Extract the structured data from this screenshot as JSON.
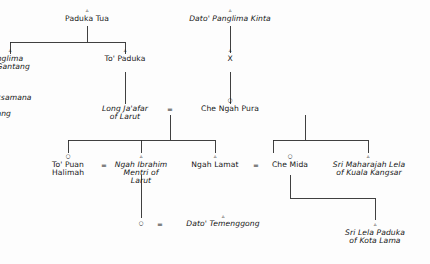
{
  "diagram": {
    "kind": "genealogy-family-tree",
    "line_color": "#2b2b2b",
    "text_color": "#151515",
    "background": "#fdfdfd",
    "symbols": {
      "male": "▵",
      "female": "○",
      "marriage": "=",
      "unknown": "X"
    }
  },
  "nodes": {
    "paduka_tua": {
      "line1": "Paduka Tua",
      "line2": "",
      "line3": ""
    },
    "dato_panglima_kinta": {
      "line1": "Dato' Panglima Kinta",
      "line2": "",
      "line3": ""
    },
    "to_panglima_bukit_gantang": {
      "line1": "To' Panglima",
      "line2": "Bukit Gantang",
      "line3": ""
    },
    "to_paduka": {
      "line1": "To' Paduka",
      "line2": "",
      "line3": ""
    },
    "x_unknown": {
      "line1": "X",
      "line2": "",
      "line3": ""
    },
    "to_laksamana_durian_sabatang": {
      "line1": "To' Laksamana",
      "line2": "Durian",
      "line3": "Sabatang"
    },
    "long_jaafar": {
      "line1": "Long Ja'afar",
      "line2": "of Larut",
      "line3": ""
    },
    "che_ngah_pura": {
      "line1": "Che Ngah Pura",
      "line2": "",
      "line3": ""
    },
    "to_puan_halimah": {
      "line1": "To' Puan",
      "line2": "Halimah",
      "line3": ""
    },
    "ngah_ibrahim": {
      "line1": "Ngah Ibrahim",
      "line2": "Mentri of",
      "line3": "Larut"
    },
    "ngah_lamat": {
      "line1": "Ngah Lamat",
      "line2": "",
      "line3": ""
    },
    "che_mida": {
      "line1": "Che Mida",
      "line2": "",
      "line3": ""
    },
    "sri_maharajah_lela": {
      "line1": "Sri Maharajah Lela",
      "line2": "of Kuala Kangsar",
      "line3": ""
    },
    "dato_temenggong": {
      "line1": "Dato' Temenggong",
      "line2": "",
      "line3": ""
    },
    "sri_lela_paduka": {
      "line1": "Sri Lela Paduka",
      "line2": "of Kota Lama",
      "line3": ""
    }
  },
  "marriage_symbols": {
    "jaafar_pura": "=",
    "halimah_ibrahim": "=",
    "lamat_mida": "=",
    "daughter_temenggong": "="
  },
  "gender_symbols": {
    "paduka_tua": "▵",
    "dato_panglima_kinta": "▵",
    "to_panglima_bukit_gantang": "▵",
    "to_paduka": "▵",
    "x_unknown": "▵",
    "che_ngah_pura": "○",
    "to_puan_halimah": "○",
    "ngah_ibrahim": "▵",
    "ngah_lamat": "▵",
    "che_mida": "○",
    "sri_maharajah_lela": "▵",
    "unnamed_daughter": "○",
    "dato_temenggong": "▵",
    "sri_lela_paduka": "▵"
  }
}
